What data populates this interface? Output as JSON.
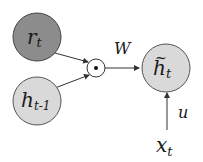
{
  "diagram": {
    "nodes": {
      "r_t": {
        "main": "r",
        "sub": "t",
        "fill": "#8c8c8c"
      },
      "h_prev": {
        "main": "h",
        "sub": "t-1",
        "fill": "#d9d9d9"
      },
      "mult": {
        "symbol": "⊙"
      },
      "h_tilde": {
        "main": "h",
        "accent": "~",
        "sub": "t",
        "fill": "#d9d9d9"
      },
      "x_t": {
        "main": "x",
        "sub": "t"
      }
    },
    "edge_labels": {
      "W": "W",
      "u": "u"
    },
    "colors": {
      "stroke": "#333333",
      "background": "#ffffff"
    }
  }
}
